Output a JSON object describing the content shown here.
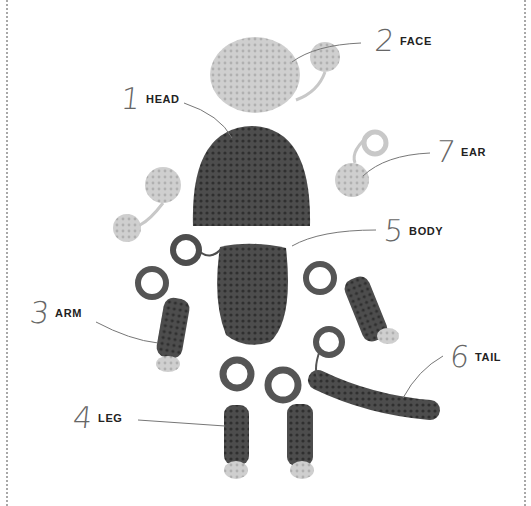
{
  "parts": [
    {
      "number": "1",
      "name": "HEAD"
    },
    {
      "number": "2",
      "name": "FACE"
    },
    {
      "number": "3",
      "name": "ARM"
    },
    {
      "number": "4",
      "name": "LEG"
    },
    {
      "number": "5",
      "name": "BODY"
    },
    {
      "number": "6",
      "name": "TAIL"
    },
    {
      "number": "7",
      "name": "EAR"
    }
  ],
  "colors": {
    "dark_yarn": "#4a4a4a",
    "light_yarn": "#c8c8c8",
    "leader_line": "#777777",
    "border": "#a8a8a8"
  }
}
